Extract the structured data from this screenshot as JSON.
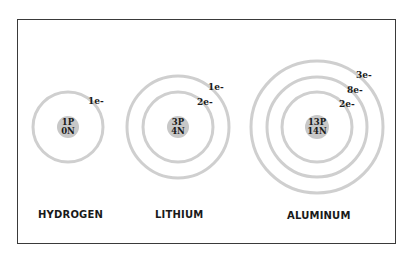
{
  "diagram": {
    "colors": {
      "orbit": "#cfcfcf",
      "nucleus": "#c8c8c8",
      "frame": "#3a3a3a",
      "text": "#1a1a1a"
    },
    "atoms": [
      {
        "name": "HYDROGEN",
        "nucleus": {
          "protons": "1P",
          "neutrons": "0N"
        },
        "shells": [
          {
            "label": "1e-"
          }
        ]
      },
      {
        "name": "LITHIUM",
        "nucleus": {
          "protons": "3P",
          "neutrons": "4N"
        },
        "shells": [
          {
            "label": "2e-"
          },
          {
            "label": "1e-"
          }
        ]
      },
      {
        "name": "ALUMINUM",
        "nucleus": {
          "protons": "13P",
          "neutrons": "14N"
        },
        "shells": [
          {
            "label": "2e-"
          },
          {
            "label": "8e-"
          },
          {
            "label": "3e-"
          }
        ]
      }
    ]
  }
}
